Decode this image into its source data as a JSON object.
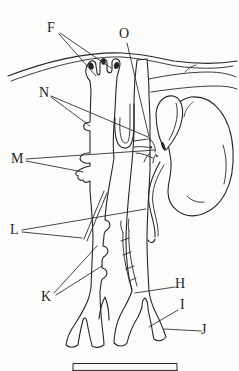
{
  "diagram": {
    "ink_color": "#262626",
    "background_color": "#fcfcfb",
    "scale_bar_present": true
  },
  "labels": {
    "f": "F",
    "o": "O",
    "n": "N",
    "m": "M",
    "l": "L",
    "k": "K",
    "h": "H",
    "i": "I",
    "j": "J"
  }
}
